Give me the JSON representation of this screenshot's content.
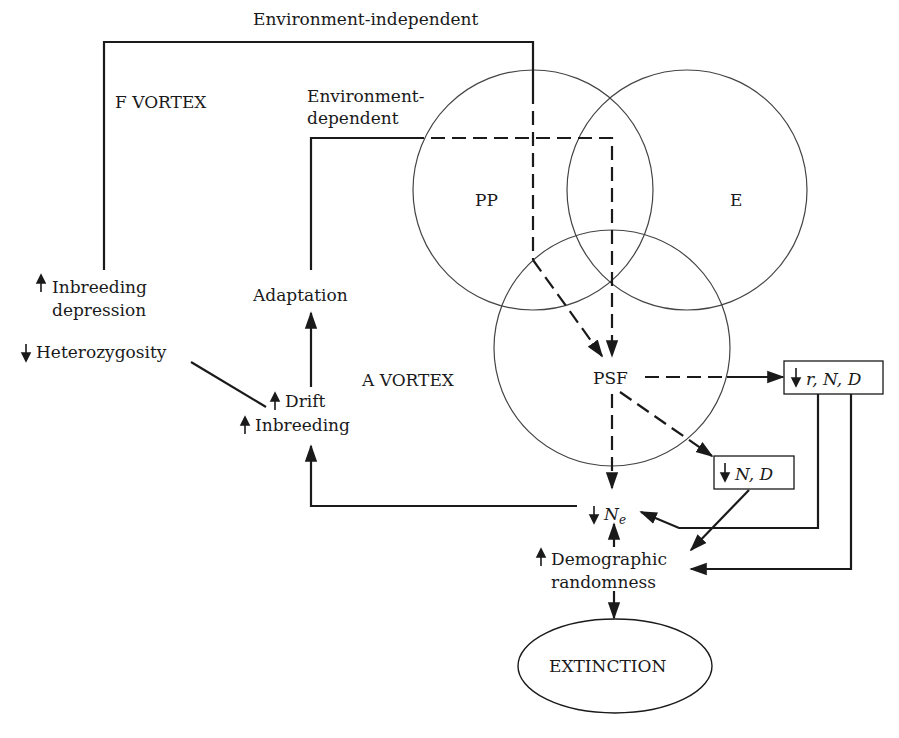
{
  "diagram": {
    "colors": {
      "line": "#1a1a1a",
      "circle": "#444444",
      "background": "#ffffff"
    },
    "vortex_labels": {
      "f_vortex": "F VORTEX",
      "a_vortex": "A VORTEX"
    },
    "path_labels": {
      "env_independent": "Environment-independent",
      "env_dependent_1": "Environment-",
      "env_dependent_2": "dependent"
    },
    "circles": {
      "pp": "PP",
      "e": "E",
      "psf": "PSF"
    },
    "nodes": {
      "inbreeding_depression_1": "Inbreeding",
      "inbreeding_depression_2": "depression",
      "inbreeding_depression_dir": "up",
      "heterozygosity": "Heterozygosity",
      "heterozygosity_dir": "down",
      "adaptation": "Adaptation",
      "drift": "Drift",
      "drift_dir": "up",
      "inbreeding": "Inbreeding",
      "inbreeding_dir": "up",
      "rnd_box": "r, N, D",
      "rnd_dir": "down",
      "nd_box": "N, D",
      "nd_dir": "down",
      "ne_main": "N",
      "ne_sub": "e",
      "ne_dir": "down",
      "demographic_1": "Demographic",
      "demographic_2": "randomness",
      "demographic_dir": "up",
      "extinction": "EXTINCTION"
    },
    "edges": [
      {
        "from": "Inbreeding depression",
        "to": "PSF",
        "via": "Environment-independent",
        "style": "solid→dashed"
      },
      {
        "from": "Adaptation",
        "to": "PSF",
        "via": "Environment-dependent",
        "style": "solid→dashed"
      },
      {
        "from": "Drift/Inbreeding",
        "to": "Adaptation",
        "style": "solid"
      },
      {
        "from": "Heterozygosity",
        "to": "Drift/Inbreeding",
        "style": "solid"
      },
      {
        "from": "PSF",
        "to": "r, N, D",
        "style": "dashed"
      },
      {
        "from": "PSF",
        "to": "N, D",
        "style": "dashed"
      },
      {
        "from": "PSF",
        "to": "Ne",
        "style": "dashed"
      },
      {
        "from": "Ne",
        "to": "Drift/Inbreeding",
        "style": "solid"
      },
      {
        "from": "r, N, D",
        "to": "Ne",
        "style": "solid"
      },
      {
        "from": "r, N, D",
        "to": "Demographic randomness",
        "style": "solid"
      },
      {
        "from": "N, D",
        "to": "Demographic randomness",
        "style": "solid"
      },
      {
        "from": "Demographic randomness",
        "to": "Ne",
        "style": "solid"
      },
      {
        "from": "Demographic randomness",
        "to": "EXTINCTION",
        "style": "solid"
      }
    ]
  }
}
